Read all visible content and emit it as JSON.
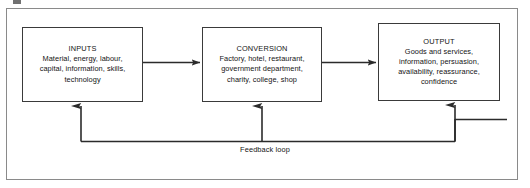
{
  "diagram": {
    "type": "process-flow",
    "frame": {
      "border_color": "#8a8a8a",
      "background": "#ffffff"
    },
    "line_color": "#2b2b2b",
    "text_color": "#141414",
    "boxes": [
      {
        "id": "inputs",
        "title": "INPUTS",
        "lines": [
          "Material, energy, labour,",
          "capital, information, skills,",
          "technology"
        ]
      },
      {
        "id": "conversion",
        "title": "CONVERSION",
        "lines": [
          "Factory, hotel, restaurant,",
          "government department,",
          "charity, college, shop"
        ]
      },
      {
        "id": "output",
        "title": "OUTPUT",
        "lines": [
          "Goods and services,",
          "information, persuasion,",
          "availability, reassurance,",
          "confidence"
        ]
      }
    ],
    "connectors": [
      {
        "id": "inputs-to-conversion",
        "from": "inputs",
        "to": "conversion",
        "direction": "right"
      },
      {
        "id": "conversion-to-output",
        "from": "conversion",
        "to": "output",
        "direction": "right"
      },
      {
        "id": "feedback-to-inputs",
        "from": "feedback-loop",
        "to": "inputs",
        "direction": "up"
      },
      {
        "id": "feedback-to-conversion",
        "from": "feedback-loop",
        "to": "conversion",
        "direction": "up"
      },
      {
        "id": "feedback-to-output",
        "from": "feedback-loop",
        "to": "output",
        "direction": "up"
      }
    ],
    "feedback_label": "Feedback loop"
  }
}
